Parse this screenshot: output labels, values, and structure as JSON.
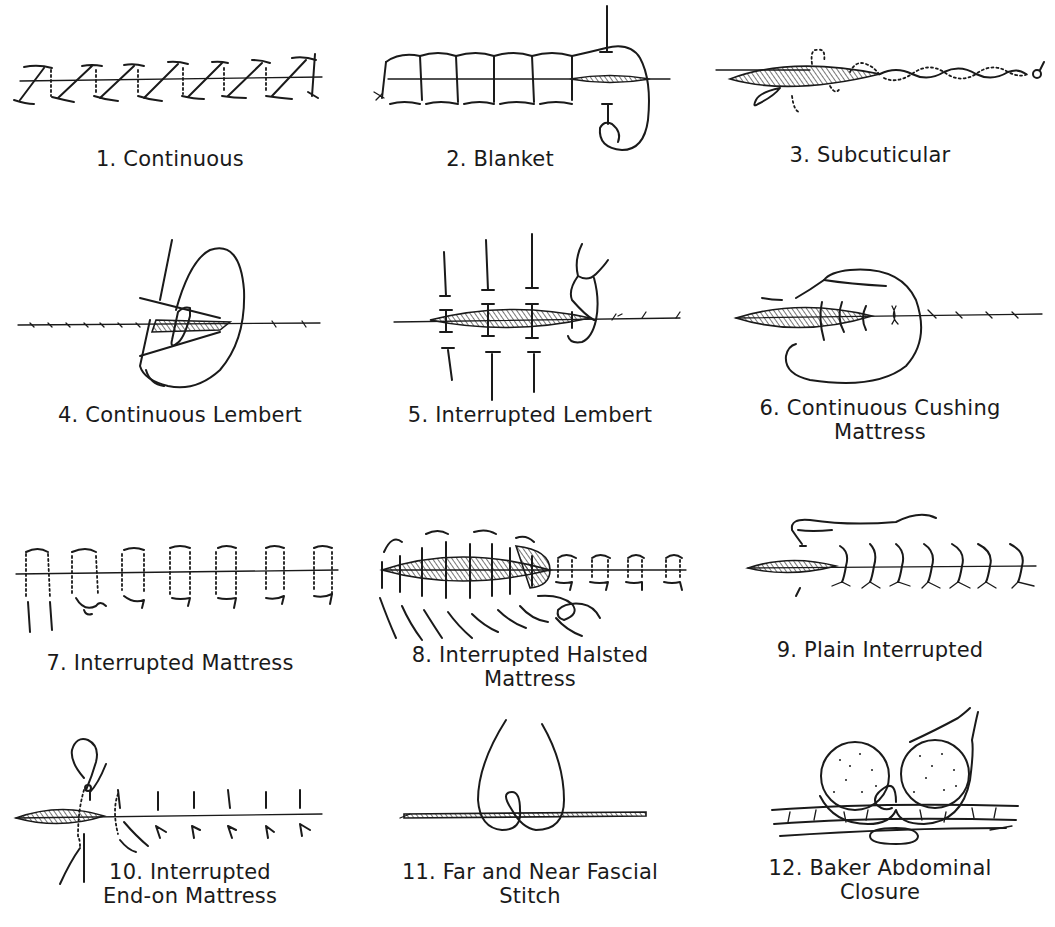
{
  "figure": {
    "panels": [
      {
        "number": "1.",
        "name": "Continuous",
        "lines": [
          "1. Continuous"
        ]
      },
      {
        "number": "2.",
        "name": "Blanket",
        "lines": [
          "2. Blanket"
        ]
      },
      {
        "number": "3.",
        "name": "Subcuticular",
        "lines": [
          "3. Subcuticular"
        ]
      },
      {
        "number": "4.",
        "name": "Continuous Lembert",
        "lines": [
          "4. Continuous Lembert"
        ]
      },
      {
        "number": "5.",
        "name": "Interrupted Lembert",
        "lines": [
          "5. Interrupted Lembert"
        ]
      },
      {
        "number": "6.",
        "name": "Continuous Cushing Mattress",
        "lines": [
          "6. Continuous Cushing",
          "Mattress"
        ]
      },
      {
        "number": "7.",
        "name": "Interrupted Mattress",
        "lines": [
          "7. Interrupted Mattress"
        ]
      },
      {
        "number": "8.",
        "name": "Interrupted Halsted Mattress",
        "lines": [
          "8. Interrupted Halsted",
          "Mattress"
        ]
      },
      {
        "number": "9.",
        "name": "Plain Interrupted",
        "lines": [
          "9. Plain Interrupted"
        ]
      },
      {
        "number": "10.",
        "name": "Interrupted End-on Mattress",
        "lines": [
          "10. Interrupted",
          "End-on Mattress"
        ]
      },
      {
        "number": "11.",
        "name": "Far and Near Fascial Stitch",
        "lines": [
          "11. Far and Near Fascial",
          "Stitch"
        ]
      },
      {
        "number": "12.",
        "name": "Baker Abdominal Closure",
        "lines": [
          "12. Baker Abdominal",
          "Closure"
        ]
      }
    ]
  }
}
